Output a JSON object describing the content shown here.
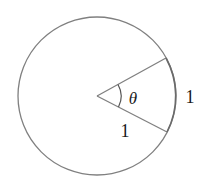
{
  "diagram": {
    "type": "circle-sector",
    "labels": {
      "angle": "θ",
      "radius": "1",
      "arc": "1"
    },
    "colors": {
      "stroke": "#808080",
      "text": "#1a1a1a",
      "background": "#ffffff"
    }
  }
}
